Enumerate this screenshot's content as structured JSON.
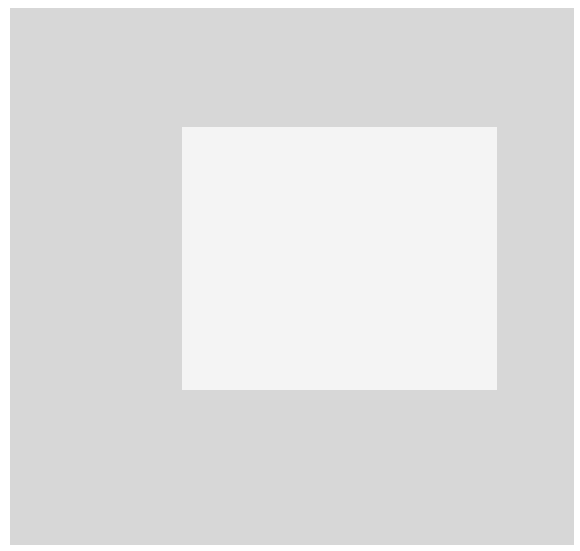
{
  "figure": {
    "type": "physics-diagram",
    "width": 580,
    "height": 551
  },
  "canvas": {
    "width": 580,
    "height": 551,
    "page_background": "#ffffff",
    "outer_margin": {
      "left": 10,
      "top": 8,
      "right": 8,
      "bottom": 6
    }
  },
  "regions": [
    {
      "name": "outer-medium",
      "label": "outer medium",
      "fill": "#d7d7d7",
      "x": 10,
      "y": 8,
      "width": 564,
      "height": 537
    },
    {
      "name": "inner-medium",
      "label": "inner medium slab",
      "fill": "#f4f4f4",
      "x": 182,
      "y": 127,
      "width": 315,
      "height": 263
    }
  ],
  "wavefronts": {
    "color": "#6e6e6e",
    "stroke_width": 4.5,
    "count": 7,
    "outer_spacing": 68,
    "inner_spacing": 64,
    "bend_radius": 11,
    "entry_y": 127,
    "exit_y": 390,
    "transition_height": 26,
    "lines": [
      {
        "id": "wavefront-1",
        "x_outer": 62,
        "x_inner": 62,
        "bends": false
      },
      {
        "id": "wavefront-2",
        "x_outer": 133,
        "x_inner": 133,
        "bends": false
      },
      {
        "id": "wavefront-3",
        "x_outer": 202,
        "x_inner": 185,
        "bends": true
      },
      {
        "id": "wavefront-4",
        "x_outer": 269,
        "x_inner": 250,
        "bends": true
      },
      {
        "id": "wavefront-5",
        "x_outer": 338,
        "x_inner": 312,
        "bends": true
      },
      {
        "id": "wavefront-6",
        "x_outer": 406,
        "x_inner": 373,
        "bends": true
      },
      {
        "id": "wavefront-7",
        "x_outer": 474,
        "x_inner": 434,
        "bends": true
      }
    ]
  },
  "arrows": {
    "color": "#545454",
    "stroke_width": 5,
    "head_length": 22,
    "head_half_width": 12,
    "items": [
      {
        "id": "incident-ray-arrow",
        "label": "incident ray",
        "x1": 50,
        "x2": 179,
        "y": 259
      },
      {
        "id": "refracted-ray-arrow",
        "label": "refracted ray",
        "x1": 206,
        "x2": 481,
        "y": 259
      }
    ]
  },
  "chart_data": {
    "type": "line",
    "xlabel": "",
    "ylabel": "",
    "categories": [
      "wavefront-1",
      "wavefront-2",
      "wavefront-3",
      "wavefront-4",
      "wavefront-5",
      "wavefront-6",
      "wavefront-7"
    ],
    "series": [
      {
        "name": "x position outside slab",
        "values": [
          62,
          133,
          202,
          269,
          338,
          406,
          474
        ]
      },
      {
        "name": "x position inside slab",
        "values": [
          62,
          133,
          185,
          250,
          312,
          373,
          434
        ]
      }
    ],
    "annotations": [
      {
        "name": "outer-spacing",
        "value": 68,
        "unit": "px"
      },
      {
        "name": "inner-spacing",
        "value": 64,
        "unit": "px"
      },
      {
        "name": "slab-left",
        "value": 182,
        "unit": "px"
      },
      {
        "name": "slab-right",
        "value": 497,
        "unit": "px"
      },
      {
        "name": "slab-top",
        "value": 127,
        "unit": "px"
      },
      {
        "name": "slab-bottom",
        "value": 390,
        "unit": "px"
      }
    ],
    "grid": false,
    "legend": "none",
    "xlim": [
      10,
      574
    ],
    "ylim": [
      8,
      545
    ]
  }
}
